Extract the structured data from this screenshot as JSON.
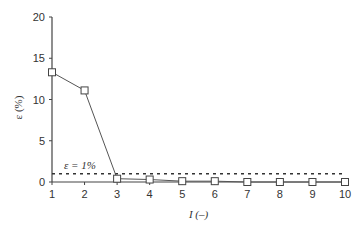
{
  "chart_data": {
    "type": "line",
    "title": "",
    "xlabel": "I (–)",
    "ylabel": "ε (%)",
    "x": [
      1,
      2,
      3,
      4,
      5,
      6,
      7,
      8,
      9,
      10
    ],
    "series": [
      {
        "name": "ε",
        "values": [
          13.3,
          11.1,
          0.4,
          0.3,
          0.1,
          0.1,
          0.0,
          0.0,
          0.0,
          0.0
        ],
        "marker": "open-square",
        "color": "#555555"
      }
    ],
    "reference_line": {
      "label": "ε = 1%",
      "y": 1,
      "style": "dotted"
    },
    "xticks": [
      "1",
      "2",
      "3",
      "4",
      "5",
      "6",
      "7",
      "8",
      "9",
      "10"
    ],
    "yticks": [
      "0",
      "5",
      "10",
      "15",
      "20"
    ],
    "xlim": [
      1,
      10
    ],
    "ylim": [
      0,
      20
    ],
    "grid": false,
    "legend": null
  }
}
